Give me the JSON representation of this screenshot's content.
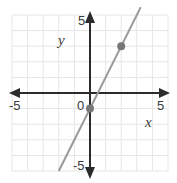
{
  "chart_data": {
    "type": "line",
    "title": "",
    "xlabel": "x",
    "ylabel": "y",
    "xlim": [
      -5,
      5
    ],
    "ylim": [
      -5,
      5
    ],
    "grid": true,
    "tick_labels": {
      "x_min": "-5",
      "x_max": "5",
      "y_min": "-5",
      "y_max": "5",
      "origin": "0"
    },
    "series": [
      {
        "name": "line",
        "equation": "y = 2x - 1",
        "x": [
          -2,
          3.25
        ],
        "y": [
          -5,
          5.5
        ],
        "color": "#9a9a9a"
      }
    ],
    "points": [
      {
        "x": 0,
        "y": -1,
        "color": "#777777"
      },
      {
        "x": 2,
        "y": 3,
        "color": "#777777"
      }
    ]
  },
  "colors": {
    "axis": "#2b2b2b",
    "grid": "#e6e6e6",
    "line": "#9a9a9a",
    "point": "#777777"
  }
}
